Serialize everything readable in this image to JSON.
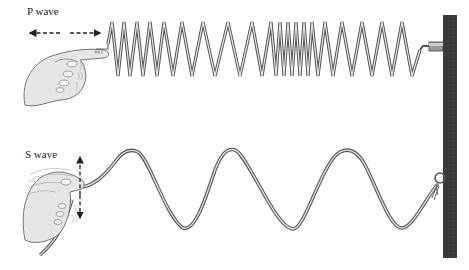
{
  "figure": {
    "p_wave": {
      "label": "P wave",
      "motion": "horizontal double arrow (compression along spring)",
      "medium": "coiled spring attached to wall"
    },
    "s_wave": {
      "label": "S wave",
      "motion": "vertical double arrow (shaking perpendicular to rope)",
      "medium": "rope tied to wall ring"
    },
    "wall": {
      "color": "#3a3a3a"
    },
    "colors": {
      "line": "#555555",
      "line_fill": "#d9d9d9",
      "hand_fill": "#e6e6e6",
      "hand_stroke": "#666666",
      "arrow": "#222222"
    }
  }
}
